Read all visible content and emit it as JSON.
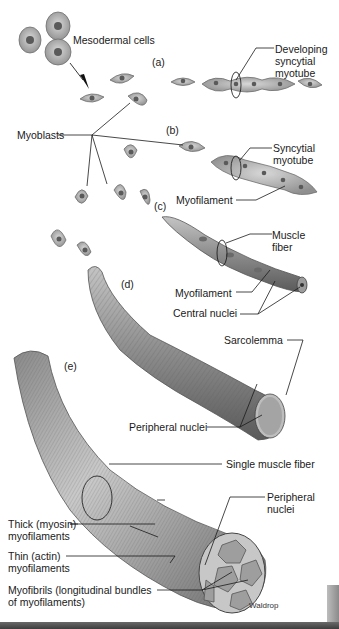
{
  "diagram": {
    "stages": [
      {
        "id": "a",
        "label": "(a)"
      },
      {
        "id": "b",
        "label": "(b)"
      },
      {
        "id": "c",
        "label": "(c)"
      },
      {
        "id": "d",
        "label": "(d)"
      },
      {
        "id": "e",
        "label": "(e)"
      }
    ],
    "labels": {
      "mesodermal_cells": "Mesodermal cells",
      "developing_myotube_1": "Developing",
      "developing_myotube_2": "syncytial",
      "developing_myotube_3": "myotube",
      "myoblasts": "Myoblasts",
      "syncytial_myotube_1": "Syncytial",
      "syncytial_myotube_2": "myotube",
      "myofilament_b": "Myofilament",
      "muscle_fiber_1": "Muscle",
      "muscle_fiber_2": "fiber",
      "myofilament_c": "Myofilament",
      "central_nuclei": "Central nuclei",
      "sarcolemma": "Sarcolemma",
      "peripheral_nuclei_d": "Peripheral nuclei",
      "single_muscle_fiber": "Single muscle fiber",
      "peripheral_nuclei_e_1": "Peripheral",
      "peripheral_nuclei_e_2": "nuclei",
      "thick_1": "Thick (myosin)",
      "thick_2": "myofilaments",
      "thin_1": "Thin (actin)",
      "thin_2": "myofilaments",
      "myofibrils_1": "Myofibrils (longitudinal bundles",
      "myofibrils_2": "of myofilaments)",
      "credit": "Waldrop"
    },
    "colors": {
      "cell_fill": "#b5b5b5",
      "cell_edge": "#6e6e6e",
      "nucleus": "#5a5a5a",
      "fiber_fill": "#9a9a9a",
      "fiber_dark": "#5c5c5c",
      "leader_line": "#1a1a1a"
    }
  }
}
